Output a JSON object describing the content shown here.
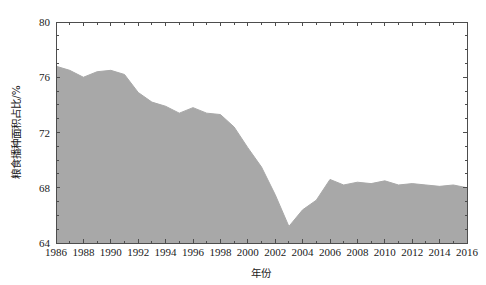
{
  "chart_data": {
    "type": "area",
    "title": "",
    "xlabel": "年份",
    "ylabel": "粮食播种面积占比/%",
    "xlim": [
      1986,
      2016
    ],
    "ylim": [
      64,
      80
    ],
    "grid": false,
    "legend": null,
    "series_color": "#a8a8a8",
    "x": [
      1986,
      1987,
      1988,
      1989,
      1990,
      1991,
      1992,
      1993,
      1994,
      1995,
      1996,
      1997,
      1998,
      1999,
      2000,
      2001,
      2002,
      2003,
      2004,
      2005,
      2006,
      2007,
      2008,
      2009,
      2010,
      2011,
      2012,
      2013,
      2014,
      2015,
      2016
    ],
    "values": [
      76.8,
      76.5,
      76.0,
      76.4,
      76.5,
      76.2,
      74.9,
      74.2,
      73.9,
      73.4,
      73.8,
      73.4,
      73.3,
      72.4,
      70.9,
      69.5,
      67.5,
      65.2,
      66.4,
      67.1,
      68.6,
      68.2,
      68.4,
      68.3,
      68.5,
      68.2,
      68.3,
      68.2,
      68.1,
      68.2,
      68.0
    ],
    "xticks": [
      1986,
      1988,
      1990,
      1992,
      1994,
      1996,
      1998,
      2000,
      2002,
      2004,
      2006,
      2008,
      2010,
      2012,
      2014,
      2016
    ],
    "xtick_labels": [
      "1986",
      "1988",
      "1990",
      "1992",
      "1994",
      "1996",
      "1998",
      "2000",
      "2002",
      "2004",
      "2006",
      "2008",
      "2010",
      "2012",
      "2014",
      "2016"
    ],
    "yticks": [
      64,
      68,
      72,
      76,
      80
    ],
    "ytick_labels": [
      "64",
      "68",
      "72",
      "76",
      "80"
    ],
    "minor_xtick_interval": 1,
    "minor_ytick_interval": 1
  },
  "axes": {
    "x_title": "年份",
    "y_title": "粮食播种面积占比/%"
  }
}
